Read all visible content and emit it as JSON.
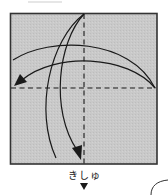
{
  "diagram": {
    "type": "origami-fold-step",
    "paper": {
      "fill": "#c8c8c8",
      "border": "#333333",
      "x": 10,
      "y": 13,
      "size": 147
    },
    "crease_lines": [
      {
        "name": "vertical-center-valley-fold",
        "style": "dashed",
        "x1": 84,
        "y1": 13,
        "x2": 84,
        "y2": 164
      },
      {
        "name": "horizontal-center-valley-fold",
        "style": "dashed",
        "x1": 10,
        "y1": 88,
        "x2": 157,
        "y2": 88
      }
    ],
    "arrows": [
      {
        "name": "fold-down-arrow",
        "direction": "top-to-bottom",
        "has_head": true
      },
      {
        "name": "fold-down-unfold-arc",
        "direction": "top-to-bottom",
        "has_head": false
      },
      {
        "name": "fold-left-arrow",
        "direction": "right-to-left",
        "has_head": true
      },
      {
        "name": "fold-left-unfold-arc",
        "direction": "right-to-left",
        "has_head": false
      }
    ],
    "ink_color": "#1a1a1a",
    "marker_label": "きしゅ",
    "marker_symbol": "▼"
  }
}
